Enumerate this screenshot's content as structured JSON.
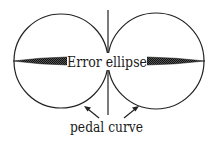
{
  "diagram": {
    "labels": {
      "ellipse": "Error ellipse",
      "pedal": "pedal curve"
    },
    "colors": {
      "stroke": "#222222",
      "fill_ellipse": "#333333",
      "text": "#1a1a1a",
      "background": "#ffffff"
    },
    "shapes": {
      "left_circle": {
        "cx": 61,
        "cy": 61,
        "r": 47
      },
      "right_circle": {
        "cx": 156,
        "cy": 61,
        "r": 48
      },
      "axis_line": {
        "x": 108,
        "y1": 10,
        "y2": 115
      }
    }
  }
}
